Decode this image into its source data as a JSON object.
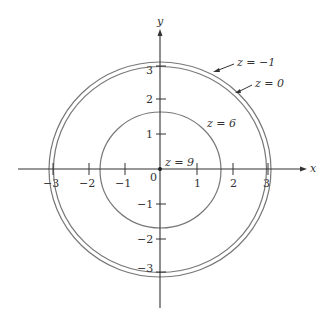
{
  "figure": {
    "colors": {
      "axis": "#333333",
      "curve": "#777777",
      "text": "#333333",
      "background": "#ffffff"
    },
    "axes": {
      "x_label": "x",
      "y_label": "y",
      "origin_label": "0",
      "x_ticks": [
        {
          "value": -3,
          "label": "−3"
        },
        {
          "value": -2,
          "label": "−2"
        },
        {
          "value": -1,
          "label": "−1"
        },
        {
          "value": 1,
          "label": "1"
        },
        {
          "value": 2,
          "label": "2"
        },
        {
          "value": 3,
          "label": "3"
        }
      ],
      "y_ticks": [
        {
          "value": 3,
          "label": "3"
        },
        {
          "value": 2,
          "label": "2"
        },
        {
          "value": 1,
          "label": "1"
        },
        {
          "value": -1,
          "label": "−1"
        },
        {
          "value": -2,
          "label": "−2"
        },
        {
          "value": -3,
          "label": "−3"
        }
      ]
    },
    "level_curves": [
      {
        "z": -1,
        "label": "z = −1",
        "shape": "circle",
        "radius": 3.16
      },
      {
        "z": 0,
        "label": "z = 0",
        "shape": "circle",
        "radius": 3.0
      },
      {
        "z": 6,
        "label": "z = 6",
        "shape": "circle",
        "radius": 1.73
      },
      {
        "z": 9,
        "label": "z = 9",
        "shape": "point",
        "radius": 0
      }
    ]
  }
}
